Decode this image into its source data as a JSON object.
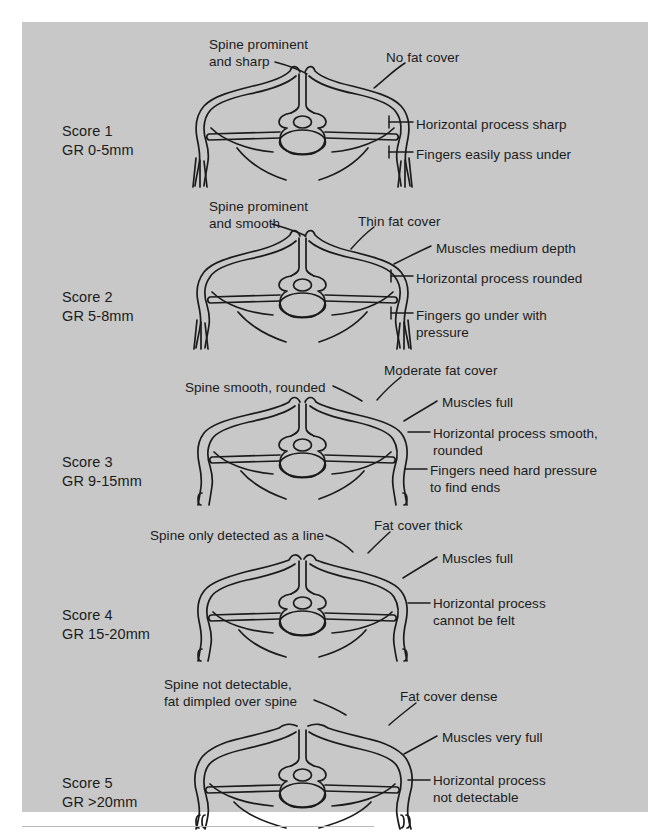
{
  "figure": {
    "background_color": "#c8c8c8",
    "line_color": "#1b1b1b",
    "page_color": "#ffffff"
  },
  "scores": [
    {
      "id": "score-1",
      "score_line": "Score 1",
      "gr_line": "GR 0-5mm",
      "callouts": {
        "spine": [
          "Spine prominent",
          "and sharp"
        ],
        "fat": [
          "No fat cover"
        ],
        "muscle": [],
        "process": [
          "Horizontal process sharp"
        ],
        "fingers": [
          "Fingers easily pass under"
        ]
      }
    },
    {
      "id": "score-2",
      "score_line": "Score 2",
      "gr_line": "GR 5-8mm",
      "callouts": {
        "spine": [
          "Spine prominent",
          "and smooth"
        ],
        "fat": [
          "Thin fat cover"
        ],
        "muscle": [
          "Muscles medium depth"
        ],
        "process": [
          "Horizontal process rounded"
        ],
        "fingers": [
          "Fingers go under with",
          "pressure"
        ]
      }
    },
    {
      "id": "score-3",
      "score_line": "Score 3",
      "gr_line": "GR 9-15mm",
      "callouts": {
        "spine": [
          "Spine smooth, rounded"
        ],
        "fat": [
          "Moderate fat cover"
        ],
        "muscle": [
          "Muscles full"
        ],
        "process": [
          "Horizontal process smooth,",
          "rounded"
        ],
        "fingers": [
          "Fingers need hard pressure",
          "to find ends"
        ]
      }
    },
    {
      "id": "score-4",
      "score_line": "Score 4",
      "gr_line": "GR 15-20mm",
      "callouts": {
        "spine": [
          "Spine only detected as a line"
        ],
        "fat": [
          "Fat cover thick"
        ],
        "muscle": [
          "Muscles full"
        ],
        "process": [
          "Horizontal process",
          "cannot be felt"
        ],
        "fingers": []
      }
    },
    {
      "id": "score-5",
      "score_line": "Score 5",
      "gr_line": "GR >20mm",
      "callouts": {
        "spine": [
          "Spine not detectable,",
          "fat dimpled over spine"
        ],
        "fat": [
          "Fat cover dense"
        ],
        "muscle": [
          "Muscles very full"
        ],
        "process": [
          "Horizontal process",
          "not detectable"
        ],
        "fingers": []
      }
    }
  ]
}
